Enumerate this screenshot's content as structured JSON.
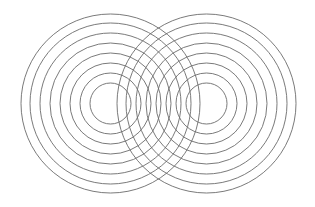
{
  "figure": {
    "background_color": "#ffffff",
    "width": 315,
    "height": 207
  },
  "chart_data": {
    "type": "scatter",
    "title": "",
    "subtitle": "",
    "xlabel": "",
    "ylabel": "",
    "xlim": [
      0,
      315
    ],
    "ylim": [
      0,
      207
    ],
    "grid": false,
    "legend": null,
    "annotations": [],
    "stroke_color": "#6b6b6b",
    "stroke_width": 0.9,
    "sources": [
      {
        "name": "left-source",
        "cx": 110.5,
        "cy": 103.5,
        "radii": [
          20.5,
          30.5,
          40.5,
          50.5,
          60.5,
          70.5,
          80.5,
          89.5
        ]
      },
      {
        "name": "right-source",
        "cx": 206.5,
        "cy": 103.5,
        "radii": [
          20.5,
          30.5,
          40.5,
          50.5,
          60.5,
          70.5,
          80.5,
          89.5
        ]
      }
    ],
    "ring_count_per_source": 8,
    "ring_spacing_px": 10,
    "source_separation_px": 96,
    "categories": [
      "left-source",
      "right-source"
    ],
    "values": [
      8,
      8
    ]
  }
}
